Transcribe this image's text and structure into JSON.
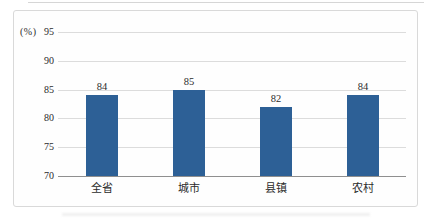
{
  "chart_data": {
    "type": "bar",
    "title": "",
    "categories": [
      "全省",
      "城市",
      "县镇",
      "农村"
    ],
    "values": [
      84,
      85,
      82,
      84
    ],
    "xlabel": "",
    "ylabel": "(%)",
    "ylim": [
      70,
      95
    ],
    "yticks": [
      70,
      75,
      80,
      85,
      90,
      95
    ],
    "grid": true,
    "legend": false,
    "bar_color": "#2d6096",
    "gridline_color": "#dcdcdc",
    "axis_color": "#8f8f8f",
    "frame_border_color": "#d9d9d9",
    "text_color": "#2b2b2b"
  }
}
